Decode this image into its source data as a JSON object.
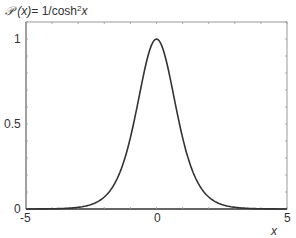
{
  "chart_data": {
    "type": "line",
    "title_parts": {
      "symbol": "𝒫",
      "arg": " (x)",
      "eq": "= 1/cosh",
      "sup": "2",
      "var": "x"
    },
    "xlabel": "x",
    "ylabel": "",
    "xlim": [
      -5,
      5
    ],
    "ylim": [
      0,
      1.1
    ],
    "xticks": [
      -5,
      0,
      5
    ],
    "xtick_labels": [
      "-5",
      "0",
      "5"
    ],
    "yticks": [
      0,
      0.5,
      1
    ],
    "ytick_labels": [
      "0",
      "0.5",
      "1"
    ],
    "minor_xtick_step": 1,
    "minor_ytick_step": 0.1,
    "grid": false,
    "legend": null,
    "series": [
      {
        "name": "1/cosh^2 x",
        "color": "#333333",
        "x": [
          -5,
          -4.5,
          -4,
          -3.5,
          -3,
          -2.5,
          -2,
          -1.75,
          -1.5,
          -1.25,
          -1,
          -0.75,
          -0.5,
          -0.25,
          0,
          0.25,
          0.5,
          0.75,
          1,
          1.25,
          1.5,
          1.75,
          2,
          2.5,
          3,
          3.5,
          4,
          4.5,
          5
        ],
        "y": [
          0.0002,
          0.0005,
          0.0013,
          0.0036,
          0.0099,
          0.0266,
          0.0707,
          0.1126,
          0.1807,
          0.2875,
          0.42,
          0.5978,
          0.7864,
          0.9405,
          1.0,
          0.9405,
          0.7864,
          0.5978,
          0.42,
          0.2875,
          0.1807,
          0.1126,
          0.0707,
          0.0266,
          0.0099,
          0.0036,
          0.0013,
          0.0005,
          0.0002
        ]
      }
    ]
  }
}
